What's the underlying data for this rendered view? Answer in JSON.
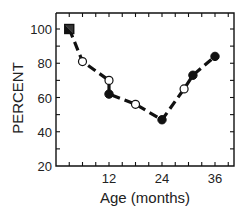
{
  "chart_data": {
    "type": "line",
    "title": "",
    "xlabel": "Age (months)",
    "ylabel": "PERCENT",
    "xlim": [
      0,
      40
    ],
    "ylim": [
      20,
      110
    ],
    "x_ticks": [
      12,
      24,
      36
    ],
    "x_tick_labels": [
      "12",
      "24",
      "36"
    ],
    "x_minor_tick_step": 3,
    "y_ticks": [
      20,
      40,
      60,
      80,
      100
    ],
    "y_tick_labels": [
      "20",
      "40",
      "60",
      "80",
      "100"
    ],
    "y_minor_tick_step": 10,
    "grid": false,
    "legend": null,
    "line_style": "dashed",
    "series": [
      {
        "name": "trend",
        "points": [
          {
            "x": 3,
            "y": 100,
            "marker": "half-filled-square"
          },
          {
            "x": 6,
            "y": 81,
            "marker": "open-circle"
          },
          {
            "x": 12,
            "y": 70,
            "marker": "open-circle"
          },
          {
            "x": 12,
            "y": 62,
            "marker": "filled-circle"
          },
          {
            "x": 18,
            "y": 56,
            "marker": "open-circle"
          },
          {
            "x": 24,
            "y": 47,
            "marker": "filled-circle"
          },
          {
            "x": 29,
            "y": 65,
            "marker": "open-circle"
          },
          {
            "x": 31,
            "y": 73,
            "marker": "filled-circle"
          },
          {
            "x": 36,
            "y": 84,
            "marker": "filled-circle"
          }
        ]
      }
    ],
    "line_path_order": [
      [
        3,
        100
      ],
      [
        6,
        81
      ],
      [
        12,
        70
      ],
      [
        12,
        62
      ],
      [
        18,
        56
      ],
      [
        24,
        47
      ],
      [
        29,
        65
      ],
      [
        31,
        73
      ],
      [
        36,
        84
      ]
    ]
  },
  "colors": {
    "ink": "#111111",
    "background": "#ffffff"
  }
}
